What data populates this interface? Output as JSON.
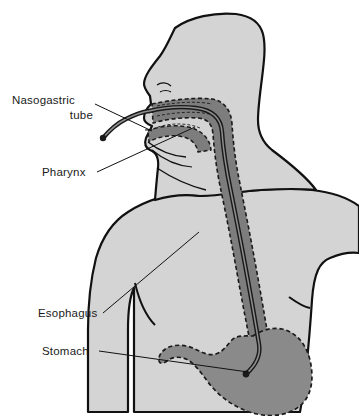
{
  "figure": {
    "background_color": "#ffffff",
    "body_fill": "#d4d4d4",
    "body_outline": "#111111",
    "passage_fill": "#7d7d7d",
    "stomach_fill": "#8a8a8a",
    "tube_color": "#1a1a1a",
    "dashed_outline_color": "#1a1a1a"
  },
  "labels": [
    {
      "id": "nasogastric-tube",
      "line1": "Nasogastric",
      "line2": "tube",
      "x": 12,
      "y": 100
    },
    {
      "id": "pharynx",
      "line1": "Pharynx",
      "line2": "",
      "x": 42,
      "y": 177
    },
    {
      "id": "esophagus",
      "line1": "Esophagus",
      "line2": "",
      "x": 38,
      "y": 317
    },
    {
      "id": "stomach",
      "line1": "Stomach",
      "line2": "",
      "x": 42,
      "y": 355
    }
  ],
  "anatomy": [
    {
      "id": "head",
      "name": "head-and-neck"
    },
    {
      "id": "torso",
      "name": "torso-and-arms"
    },
    {
      "id": "nasal-cavity",
      "name": "nasal-cavity"
    },
    {
      "id": "oral-cavity",
      "name": "oral-cavity-tongue"
    },
    {
      "id": "pharynx-passage",
      "name": "pharynx-passage"
    },
    {
      "id": "esophagus-passage",
      "name": "esophagus-passage"
    },
    {
      "id": "stomach-organ",
      "name": "stomach-organ"
    },
    {
      "id": "ng-tube",
      "name": "nasogastric-tube-path"
    },
    {
      "id": "tube-tip",
      "name": "tube-tip-in-stomach"
    },
    {
      "id": "tube-external-end",
      "name": "tube-external-end"
    }
  ]
}
